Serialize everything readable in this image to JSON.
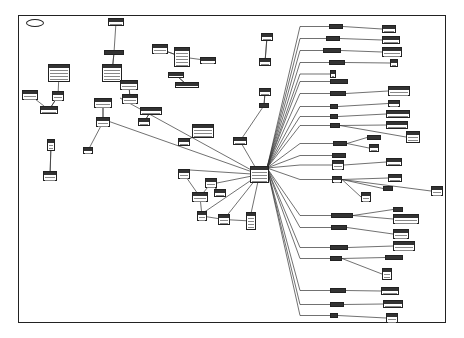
{
  "diagram": {
    "type": "entity-relationship schema (scanned, labels illegible)",
    "colors": {
      "background": "#ffffff",
      "line": "#333333",
      "frame": "#222222",
      "header": "#333333"
    },
    "frame": {
      "x": 18,
      "y": 15,
      "w": 428,
      "h": 308
    },
    "legend_oval": {
      "x": 26,
      "y": 19,
      "w": 16,
      "h": 6
    },
    "hub": {
      "x": 250,
      "y": 166,
      "w": 19,
      "h": 17
    },
    "entities": [
      {
        "x": 108,
        "y": 18,
        "w": 16,
        "h": 8
      },
      {
        "x": 104,
        "y": 50,
        "w": 20,
        "h": 5
      },
      {
        "x": 152,
        "y": 44,
        "w": 16,
        "h": 10
      },
      {
        "x": 174,
        "y": 47,
        "w": 16,
        "h": 20
      },
      {
        "x": 200,
        "y": 57,
        "w": 16,
        "h": 7
      },
      {
        "x": 175,
        "y": 82,
        "w": 24,
        "h": 6
      },
      {
        "x": 168,
        "y": 72,
        "w": 16,
        "h": 6
      },
      {
        "x": 48,
        "y": 64,
        "w": 22,
        "h": 18
      },
      {
        "x": 102,
        "y": 64,
        "w": 20,
        "h": 18
      },
      {
        "x": 120,
        "y": 80,
        "w": 18,
        "h": 10
      },
      {
        "x": 122,
        "y": 94,
        "w": 16,
        "h": 10
      },
      {
        "x": 22,
        "y": 90,
        "w": 16,
        "h": 10
      },
      {
        "x": 52,
        "y": 91,
        "w": 12,
        "h": 10
      },
      {
        "x": 94,
        "y": 98,
        "w": 18,
        "h": 10
      },
      {
        "x": 40,
        "y": 106,
        "w": 18,
        "h": 8
      },
      {
        "x": 96,
        "y": 117,
        "w": 14,
        "h": 10
      },
      {
        "x": 140,
        "y": 107,
        "w": 22,
        "h": 8
      },
      {
        "x": 138,
        "y": 118,
        "w": 12,
        "h": 8
      },
      {
        "x": 47,
        "y": 139,
        "w": 8,
        "h": 12
      },
      {
        "x": 83,
        "y": 147,
        "w": 10,
        "h": 7
      },
      {
        "x": 43,
        "y": 171,
        "w": 14,
        "h": 10
      },
      {
        "x": 192,
        "y": 124,
        "w": 22,
        "h": 14
      },
      {
        "x": 178,
        "y": 138,
        "w": 12,
        "h": 8
      },
      {
        "x": 233,
        "y": 137,
        "w": 14,
        "h": 8
      },
      {
        "x": 178,
        "y": 169,
        "w": 12,
        "h": 10
      },
      {
        "x": 205,
        "y": 178,
        "w": 12,
        "h": 10
      },
      {
        "x": 192,
        "y": 192,
        "w": 16,
        "h": 10
      },
      {
        "x": 214,
        "y": 189,
        "w": 12,
        "h": 8
      },
      {
        "x": 197,
        "y": 211,
        "w": 10,
        "h": 10
      },
      {
        "x": 218,
        "y": 214,
        "w": 12,
        "h": 11
      },
      {
        "x": 246,
        "y": 212,
        "w": 10,
        "h": 18
      },
      {
        "x": 261,
        "y": 33,
        "w": 12,
        "h": 8
      },
      {
        "x": 259,
        "y": 58,
        "w": 12,
        "h": 8
      },
      {
        "x": 259,
        "y": 88,
        "w": 12,
        "h": 8
      },
      {
        "x": 259,
        "y": 103,
        "w": 10,
        "h": 5
      },
      {
        "x": 329,
        "y": 24,
        "w": 14,
        "h": 5
      },
      {
        "x": 326,
        "y": 36,
        "w": 14,
        "h": 5
      },
      {
        "x": 323,
        "y": 48,
        "w": 18,
        "h": 5
      },
      {
        "x": 329,
        "y": 60,
        "w": 16,
        "h": 5
      },
      {
        "x": 330,
        "y": 70,
        "w": 6,
        "h": 8
      },
      {
        "x": 330,
        "y": 79,
        "w": 18,
        "h": 5
      },
      {
        "x": 330,
        "y": 91,
        "w": 16,
        "h": 5
      },
      {
        "x": 330,
        "y": 104,
        "w": 8,
        "h": 5
      },
      {
        "x": 330,
        "y": 114,
        "w": 8,
        "h": 5
      },
      {
        "x": 330,
        "y": 123,
        "w": 10,
        "h": 5
      },
      {
        "x": 382,
        "y": 25,
        "w": 14,
        "h": 8
      },
      {
        "x": 382,
        "y": 36,
        "w": 18,
        "h": 8
      },
      {
        "x": 382,
        "y": 47,
        "w": 20,
        "h": 10
      },
      {
        "x": 390,
        "y": 59,
        "w": 8,
        "h": 8
      },
      {
        "x": 388,
        "y": 86,
        "w": 22,
        "h": 10
      },
      {
        "x": 388,
        "y": 100,
        "w": 12,
        "h": 7
      },
      {
        "x": 386,
        "y": 110,
        "w": 24,
        "h": 8
      },
      {
        "x": 386,
        "y": 121,
        "w": 22,
        "h": 8
      },
      {
        "x": 406,
        "y": 131,
        "w": 14,
        "h": 12
      },
      {
        "x": 367,
        "y": 135,
        "w": 14,
        "h": 5
      },
      {
        "x": 333,
        "y": 141,
        "w": 14,
        "h": 5
      },
      {
        "x": 369,
        "y": 144,
        "w": 10,
        "h": 8
      },
      {
        "x": 332,
        "y": 153,
        "w": 14,
        "h": 5
      },
      {
        "x": 332,
        "y": 160,
        "w": 12,
        "h": 10
      },
      {
        "x": 386,
        "y": 158,
        "w": 16,
        "h": 8
      },
      {
        "x": 388,
        "y": 174,
        "w": 14,
        "h": 8
      },
      {
        "x": 332,
        "y": 176,
        "w": 10,
        "h": 7
      },
      {
        "x": 431,
        "y": 186,
        "w": 12,
        "h": 10
      },
      {
        "x": 383,
        "y": 186,
        "w": 10,
        "h": 5
      },
      {
        "x": 361,
        "y": 192,
        "w": 10,
        "h": 10
      },
      {
        "x": 393,
        "y": 207,
        "w": 10,
        "h": 5
      },
      {
        "x": 331,
        "y": 213,
        "w": 22,
        "h": 5
      },
      {
        "x": 393,
        "y": 214,
        "w": 26,
        "h": 10
      },
      {
        "x": 331,
        "y": 225,
        "w": 16,
        "h": 5
      },
      {
        "x": 393,
        "y": 229,
        "w": 16,
        "h": 10
      },
      {
        "x": 330,
        "y": 245,
        "w": 18,
        "h": 5
      },
      {
        "x": 393,
        "y": 241,
        "w": 22,
        "h": 10
      },
      {
        "x": 330,
        "y": 256,
        "w": 12,
        "h": 5
      },
      {
        "x": 385,
        "y": 255,
        "w": 18,
        "h": 5
      },
      {
        "x": 382,
        "y": 268,
        "w": 10,
        "h": 12
      },
      {
        "x": 330,
        "y": 288,
        "w": 16,
        "h": 5
      },
      {
        "x": 381,
        "y": 287,
        "w": 18,
        "h": 8
      },
      {
        "x": 330,
        "y": 302,
        "w": 14,
        "h": 5
      },
      {
        "x": 383,
        "y": 300,
        "w": 20,
        "h": 8
      },
      {
        "x": 330,
        "y": 313,
        "w": 8,
        "h": 5
      },
      {
        "x": 386,
        "y": 313,
        "w": 12,
        "h": 10
      }
    ]
  }
}
